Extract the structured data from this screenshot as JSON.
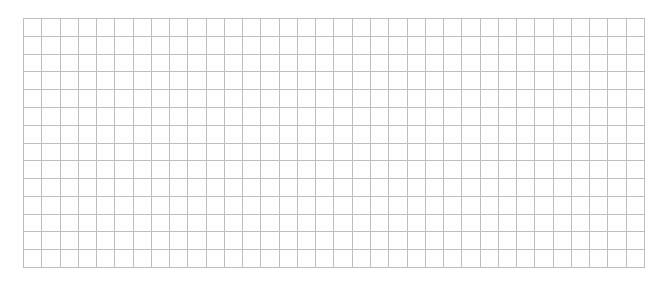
{
  "grid": {
    "columns": 34,
    "rows": 14,
    "line_color": "#bdbdbd",
    "background": "#ffffff"
  }
}
